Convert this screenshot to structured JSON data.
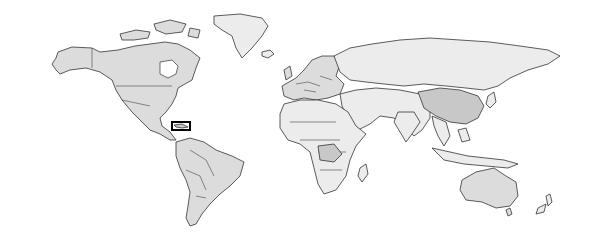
{
  "map": {
    "type": "world-choropleth",
    "projection": "equirectangular",
    "colors": {
      "background": "#ffffff",
      "land_light": "#ececec",
      "land_mid": "#dcdcdc",
      "land_dark": "#c8c8c8",
      "border": "#333333",
      "highlight_box": "#000000"
    },
    "highlight": {
      "region": "Cuba",
      "box": {
        "x": 172,
        "y": 122,
        "width": 18,
        "height": 8
      }
    },
    "regions": [
      {
        "name": "north-america",
        "shade": "land_mid"
      },
      {
        "name": "greenland",
        "shade": "land_light"
      },
      {
        "name": "south-america",
        "shade": "land_mid"
      },
      {
        "name": "europe",
        "shade": "land_mid"
      },
      {
        "name": "africa",
        "shade": "land_light"
      },
      {
        "name": "russia",
        "shade": "land_light"
      },
      {
        "name": "asia",
        "shade": "land_light"
      },
      {
        "name": "china",
        "shade": "land_dark"
      },
      {
        "name": "india",
        "shade": "land_light"
      },
      {
        "name": "southeast-asia",
        "shade": "land_light"
      },
      {
        "name": "australia",
        "shade": "land_mid"
      },
      {
        "name": "new-zealand",
        "shade": "land_light"
      }
    ]
  }
}
